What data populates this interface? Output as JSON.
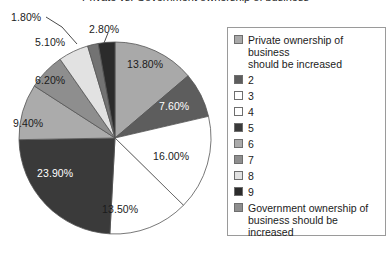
{
  "title_fragment": "Private vs. Government ownership of business",
  "chart_data": {
    "type": "pie",
    "title": "Private vs. Government ownership of business",
    "xlabel": "",
    "ylabel": "",
    "legend_position": "right",
    "grid": false,
    "start_angle_deg": 0,
    "direction": "clockwise",
    "categories": [
      "Private ownership of business should be increased",
      "2",
      "3",
      "4",
      "5",
      "6",
      "7",
      "8",
      "9",
      "Government ownership of business should be increased"
    ],
    "values": [
      13.8,
      7.6,
      16.0,
      13.5,
      23.9,
      9.4,
      6.2,
      5.1,
      1.8,
      2.8
    ],
    "value_labels": [
      "13.80%",
      "7.60%",
      "16.00%",
      "13.50%",
      "23.90%",
      "9.40%",
      "6.20%",
      "5.10%",
      "1.80%",
      "2.80%"
    ],
    "colors": [
      "#a9a9a9",
      "#5d5d5d",
      "#ffffff",
      "#ffffff",
      "#3a3a3a",
      "#ababab",
      "#8e8e8e",
      "#e2e2e2",
      "#737373",
      "#2b2b2b"
    ]
  },
  "legend": {
    "items": [
      {
        "label": "Private ownership of business\nshould be increased",
        "color": "#a9a9a9"
      },
      {
        "label": "2",
        "color": "#5d5d5d"
      },
      {
        "label": "3",
        "color": "#ffffff"
      },
      {
        "label": "4",
        "color": "#ffffff"
      },
      {
        "label": "5",
        "color": "#3a3a3a"
      },
      {
        "label": "6",
        "color": "#ababab"
      },
      {
        "label": "7",
        "color": "#8e8e8e"
      },
      {
        "label": "8",
        "color": "#e2e2e2"
      },
      {
        "label": "9",
        "color": "#2b2b2b"
      },
      {
        "label": "Government ownership of\nbusiness should be increased",
        "color": "#8e8e8e"
      }
    ]
  },
  "slice_labels": [
    {
      "text": "13.80%",
      "left": 127,
      "top": 58,
      "on_dark": false
    },
    {
      "text": "7.60%",
      "left": 159,
      "top": 100,
      "on_dark": true
    },
    {
      "text": "16.00%",
      "left": 153,
      "top": 150,
      "on_dark": false
    },
    {
      "text": "13.50%",
      "left": 102,
      "top": 203,
      "on_dark": false
    },
    {
      "text": "23.90%",
      "left": 37,
      "top": 167,
      "on_dark": true
    },
    {
      "text": "9.40%",
      "left": 13,
      "top": 117,
      "on_dark": false
    },
    {
      "text": "6.20%",
      "left": 35,
      "top": 74,
      "on_dark": false
    },
    {
      "text": "5.10%",
      "left": 35,
      "top": 36,
      "on_dark": false
    },
    {
      "text": "1.80%",
      "left": 11,
      "top": 11,
      "on_dark": false
    },
    {
      "text": "2.80%",
      "left": 89,
      "top": 23,
      "on_dark": false
    }
  ]
}
